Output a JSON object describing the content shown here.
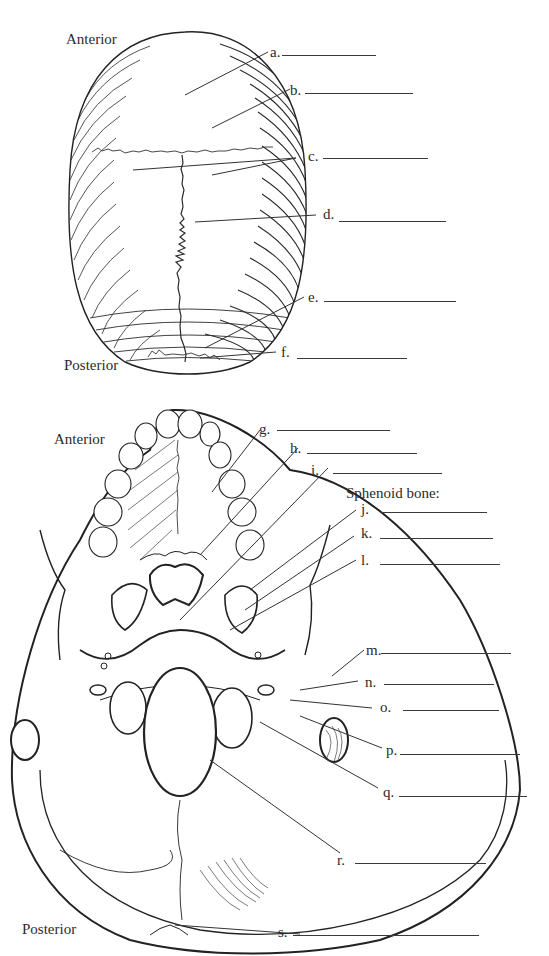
{
  "superior_view": {
    "orientation": {
      "top": "Anterior",
      "bottom": "Posterior"
    },
    "labels": [
      {
        "letter": "a.",
        "answer": ""
      },
      {
        "letter": "b.",
        "answer": ""
      },
      {
        "letter": "c.",
        "answer": ""
      },
      {
        "letter": "d.",
        "answer": ""
      },
      {
        "letter": "e.",
        "answer": ""
      },
      {
        "letter": "f.",
        "answer": ""
      }
    ]
  },
  "inferior_view": {
    "orientation": {
      "top": "Anterior",
      "bottom": "Posterior"
    },
    "group_heading": "Sphenoid bone:",
    "labels": [
      {
        "letter": "g.",
        "answer": ""
      },
      {
        "letter": "h.",
        "answer": ""
      },
      {
        "letter": "i.",
        "answer": ""
      },
      {
        "letter": "j.",
        "answer": ""
      },
      {
        "letter": "k.",
        "answer": ""
      },
      {
        "letter": "l.",
        "answer": ""
      },
      {
        "letter": "m.",
        "answer": ""
      },
      {
        "letter": "n.",
        "answer": ""
      },
      {
        "letter": "o.",
        "answer": ""
      },
      {
        "letter": "p.",
        "answer": ""
      },
      {
        "letter": "q.",
        "answer": ""
      },
      {
        "letter": "r.",
        "answer": ""
      },
      {
        "letter": "s.",
        "answer": ""
      }
    ]
  },
  "colors": {
    "ink": "#2b2b2b",
    "background": "#ffffff"
  }
}
